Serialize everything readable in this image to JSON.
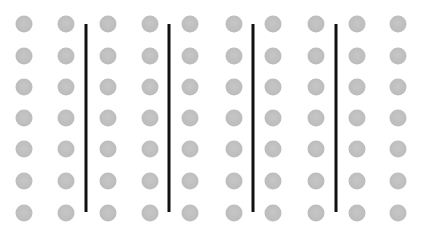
{
  "figure": {
    "dot_color": "#bdbdbd",
    "line_color": "#111111",
    "dot_diameter": 17,
    "columns_x": [
      24,
      66,
      108,
      150,
      190,
      234,
      273,
      316,
      357,
      398
    ],
    "rows_y": [
      24,
      56,
      87,
      118,
      149,
      181,
      213
    ],
    "lines": [
      {
        "x": 86,
        "y1": 24,
        "y2": 212
      },
      {
        "x": 169,
        "y1": 24,
        "y2": 212
      },
      {
        "x": 253,
        "y1": 24,
        "y2": 212
      },
      {
        "x": 336,
        "y1": 24,
        "y2": 212
      }
    ]
  }
}
